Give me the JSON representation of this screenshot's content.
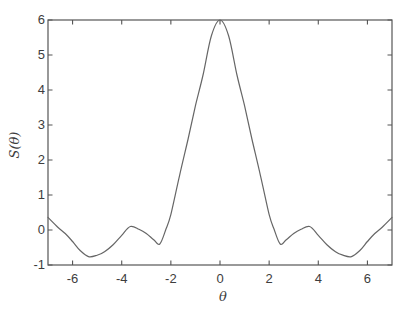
{
  "figure": {
    "background": "#ffffff",
    "axis_color": "#555555",
    "curve_color": "#666666",
    "label_color": "#3d3d3d"
  },
  "chart_data": {
    "type": "line",
    "title": "",
    "xlabel": "θ",
    "ylabel": "S(θ)",
    "xlim": [
      -7,
      7
    ],
    "ylim": [
      -1,
      6
    ],
    "xticks": [
      -6,
      -4,
      -2,
      0,
      2,
      4,
      6
    ],
    "yticks": [
      -1,
      0,
      1,
      2,
      3,
      4,
      5,
      6
    ],
    "grid": false,
    "legend": null,
    "frame": "box-with-mirrored-ticks",
    "series": [
      {
        "name": "S(theta)",
        "x": [
          -7,
          -6.6,
          -6.3,
          -6,
          -5.7,
          -5.35,
          -5,
          -4.7,
          -4.35,
          -4,
          -3.65,
          -3.3,
          -3,
          -2.7,
          -2.45,
          -2.2,
          -2,
          -1.65,
          -1.3,
          -1,
          -0.7,
          -0.35,
          0,
          0.35,
          0.7,
          1,
          1.3,
          1.65,
          2,
          2.2,
          2.45,
          2.7,
          3,
          3.3,
          3.65,
          4,
          4.35,
          4.7,
          5,
          5.35,
          5.7,
          6,
          6.3,
          6.6,
          7
        ],
        "y": [
          0.36,
          0.08,
          -0.1,
          -0.33,
          -0.58,
          -0.76,
          -0.72,
          -0.62,
          -0.42,
          -0.15,
          0.1,
          0.02,
          -0.1,
          -0.28,
          -0.4,
          0.02,
          0.45,
          1.55,
          2.6,
          3.55,
          4.4,
          5.55,
          6.0,
          5.55,
          4.4,
          3.55,
          2.6,
          1.55,
          0.45,
          0.02,
          -0.4,
          -0.28,
          -0.1,
          0.02,
          0.1,
          -0.15,
          -0.42,
          -0.62,
          -0.72,
          -0.76,
          -0.58,
          -0.33,
          -0.1,
          0.08,
          0.36
        ]
      }
    ],
    "notes": {
      "peak_value": 6,
      "peak_at": 0,
      "first_side_minimum": -0.4,
      "deep_side_minimum": -0.76
    }
  }
}
